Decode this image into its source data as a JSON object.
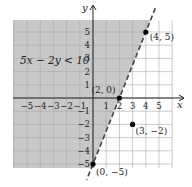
{
  "chart_data": {
    "type": "scatter",
    "title": "",
    "inequality_label": "5x − 2y < 10",
    "xlabel": "x",
    "ylabel": "y",
    "xlim": [
      -6,
      6
    ],
    "ylim": [
      -5.3,
      6
    ],
    "grid": true,
    "x_ticks": [
      -5,
      -4,
      -3,
      -2,
      -1,
      1,
      2,
      3,
      4,
      5
    ],
    "y_ticks": [
      5,
      4,
      3,
      2,
      1,
      -1,
      -2,
      -3,
      -4,
      -5
    ],
    "x_tick_labels": [
      "−5",
      "−4",
      "−3",
      "−2",
      "−1",
      "1",
      "2",
      "3",
      "4",
      "5"
    ],
    "y_tick_labels": [
      "5",
      "4",
      "3",
      "2",
      "1",
      "−1",
      "−2",
      "−3",
      "−4",
      "−5"
    ],
    "boundary_line": {
      "equation": "5x − 2y = 10",
      "style": "dashed",
      "slope": 2.5,
      "y_intercept": -5
    },
    "shaded_region": "left of line (5x − 2y < 10)",
    "points": [
      {
        "x": 2,
        "y": 0,
        "label": "(2, 0)"
      },
      {
        "x": 4,
        "y": 5,
        "label": "(4, 5)"
      },
      {
        "x": 3,
        "y": -2,
        "label": "(3, −2)"
      },
      {
        "x": 0,
        "y": -5,
        "label": "(0, −5)"
      }
    ]
  },
  "colors": {
    "shade": "#c8c8c8",
    "grid": "#a9a9a9",
    "axis": "#222222",
    "line": "#444444",
    "point": "#000000"
  }
}
